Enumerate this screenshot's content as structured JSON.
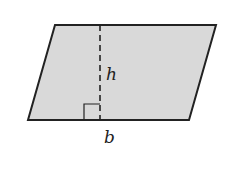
{
  "diagram": {
    "shape": "parallelogram",
    "fill_color": "#d9d9d9",
    "stroke_color": "#222222",
    "vertices": [
      [
        55,
        25
      ],
      [
        216,
        25
      ],
      [
        189,
        120
      ],
      [
        28,
        120
      ]
    ],
    "height_line": {
      "x": 100,
      "y1": 25,
      "y2": 120,
      "style": "dashed"
    },
    "right_angle_marker": {
      "x": 84,
      "y": 104,
      "size": 16
    },
    "labels": {
      "height": "h",
      "base": "b"
    }
  }
}
